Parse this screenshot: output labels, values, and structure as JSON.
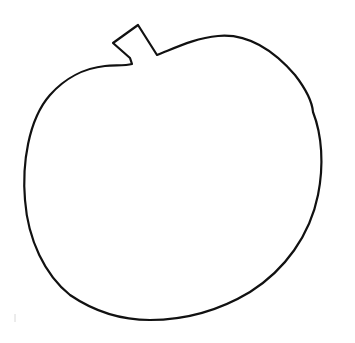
{
  "drawing": {
    "subject": "apple outline",
    "stroke_color": "#111111",
    "background_color": "#ffffff",
    "stray_mark_color": "#d8d8d8"
  }
}
